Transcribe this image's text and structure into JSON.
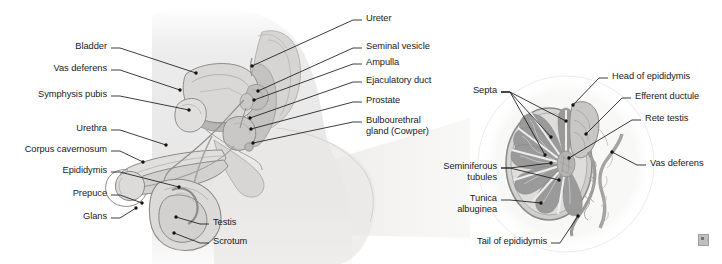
{
  "figure": {
    "background_color": "#ffffff",
    "line_color": "#1a1a1a",
    "text_color": "#1a1a1a"
  },
  "panels": {
    "left": {
      "name": "midsagittal-pelvis-view",
      "labels": [
        {
          "id": "bladder",
          "text": "Bladder",
          "x": 107,
          "y": 48,
          "align": "r",
          "dot": [
            196,
            73
          ],
          "via": []
        },
        {
          "id": "vas-deferens",
          "text": "Vas deferens",
          "x": 107,
          "y": 70,
          "align": "r",
          "dot": [
            180,
            90
          ],
          "via": []
        },
        {
          "id": "symphysis-pubis",
          "text": "Symphysis pubis",
          "x": 107,
          "y": 96,
          "align": "r",
          "dot": [
            189,
            110
          ],
          "via": []
        },
        {
          "id": "urethra",
          "text": "Urethra",
          "x": 107,
          "y": 130,
          "align": "r",
          "dot": [
            166,
            145
          ],
          "via": []
        },
        {
          "id": "corpus-cavernosum",
          "text": "Corpus cavernosum",
          "x": 107,
          "y": 151,
          "align": "r",
          "dot": [
            143,
            162
          ],
          "via": []
        },
        {
          "id": "epididymis",
          "text": "Epididymis",
          "x": 107,
          "y": 172,
          "align": "r",
          "dot": [
            179,
            187
          ],
          "via": []
        },
        {
          "id": "prepuce",
          "text": "Prepuce",
          "x": 107,
          "y": 195,
          "align": "r",
          "dot": [
            142,
            203
          ],
          "via": []
        },
        {
          "id": "glans",
          "text": "Glans",
          "x": 107,
          "y": 218,
          "align": "r",
          "dot": [
            136,
            208
          ],
          "via": []
        },
        {
          "id": "testis",
          "text": "Testis",
          "x": 213,
          "y": 224,
          "align": "l",
          "dot": [
            176,
            217
          ],
          "via": []
        },
        {
          "id": "scrotum",
          "text": "Scrotum",
          "x": 213,
          "y": 243,
          "align": "l",
          "dot": [
            174,
            233
          ],
          "via": []
        },
        {
          "id": "ureter",
          "text": "Ureter",
          "x": 366,
          "y": 20,
          "align": "l",
          "dot": [
            252,
            66
          ],
          "via": []
        },
        {
          "id": "seminal-vesicle",
          "text": "Seminal vesicle",
          "x": 366,
          "y": 48,
          "align": "l",
          "dot": [
            258,
            91
          ],
          "via": []
        },
        {
          "id": "ampulla",
          "text": "Ampulla",
          "x": 366,
          "y": 64,
          "align": "l",
          "dot": [
            254,
            100
          ],
          "via": []
        },
        {
          "id": "ejaculatory-duct",
          "text": "Ejaculatory duct",
          "x": 366,
          "y": 82,
          "align": "l",
          "dot": [
            250,
            118
          ],
          "via": []
        },
        {
          "id": "prostate",
          "text": "Prostate",
          "x": 366,
          "y": 102,
          "align": "l",
          "dot": [
            251,
            129
          ],
          "via": []
        },
        {
          "id": "bulbourethral",
          "text": "Bulbourethral\ngland (Cowper)",
          "x": 366,
          "y": 122,
          "align": "l",
          "dot": [
            253,
            143
          ],
          "via": []
        }
      ]
    },
    "right": {
      "name": "testis-cross-section-view",
      "labels": [
        {
          "id": "septa",
          "text": "Septa",
          "x": 497,
          "y": 92,
          "align": "r",
          "multi_dots": [
            [
              566,
              121
            ],
            [
              551,
              137
            ],
            [
              545,
              155
            ]
          ]
        },
        {
          "id": "seminiferous-tubules",
          "text": "Seminiferous\ntubules",
          "x": 497,
          "y": 168,
          "align": "r",
          "multi_dots": [
            [
              551,
              163
            ],
            [
              559,
              180
            ]
          ]
        },
        {
          "id": "tunica-albuginea",
          "text": "Tunica\nalbuginea",
          "x": 497,
          "y": 200,
          "align": "r",
          "multi_dots": [
            [
              541,
              203
            ]
          ]
        },
        {
          "id": "tail-of-epididymis",
          "text": "Tail of epididymis",
          "x": 547,
          "y": 243,
          "align": "r",
          "multi_dots": [
            [
              578,
              216
            ]
          ]
        },
        {
          "id": "head-of-epididymis",
          "text": "Head of epididymis",
          "x": 612,
          "y": 78,
          "align": "l",
          "multi_dots": [
            [
              573,
              105
            ]
          ]
        },
        {
          "id": "efferent-ductule",
          "text": "Efferent ductule",
          "x": 635,
          "y": 98,
          "align": "l",
          "multi_dots": [
            [
              586,
              134
            ]
          ]
        },
        {
          "id": "rete-testis",
          "text": "Rete testis",
          "x": 645,
          "y": 120,
          "align": "l",
          "multi_dots": [
            [
              569,
              158
            ]
          ]
        },
        {
          "id": "vas-deferens-r",
          "text": "Vas deferens",
          "x": 650,
          "y": 165,
          "align": "l",
          "multi_dots": [
            [
              612,
              152
            ]
          ]
        }
      ]
    }
  },
  "colors": {
    "outline": "#7e7e7e",
    "body_tint": "#eceaea",
    "organ_light": "#dcdcdc",
    "organ_mid": "#c2c2c2",
    "organ_dark": "#9d9d9d",
    "lobule": "#9a9a9a",
    "septa": "#e2e2e2",
    "leader": "#1a1a1a",
    "magnify_wedge": "#f1f0ef"
  },
  "corner_mark": {
    "name": "publisher-watermark",
    "present": true
  }
}
